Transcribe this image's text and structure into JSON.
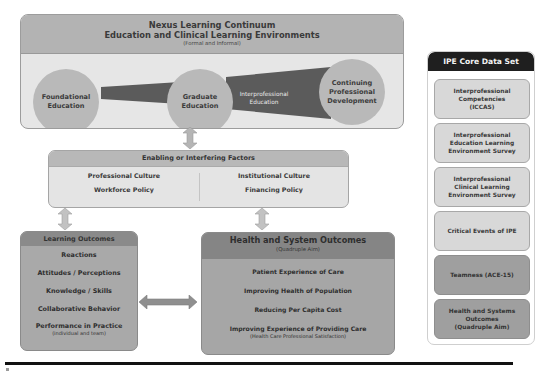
{
  "nexus": {
    "title_line1": "Nexus Learning Continuum",
    "title_line2": "Education and Clinical Learning Environments",
    "subtitle": "(Formal and Informal)",
    "stages": [
      {
        "label": "Foundational Education"
      },
      {
        "label": "Graduate Education"
      },
      {
        "label": "Interprofessional Education"
      },
      {
        "label": "Continuing Professional Development"
      }
    ]
  },
  "enabling": {
    "title": "Enabling or Interfering Factors",
    "left": [
      "Professional Culture",
      "Workforce Policy"
    ],
    "right": [
      "Institutional Culture",
      "Financing Policy"
    ]
  },
  "learning_outcomes": {
    "title": "Learning Outcomes",
    "items": [
      "Reactions",
      "Attitudes / Perceptions",
      "Knowledge / Skills",
      "Collaborative Behavior",
      "Performance in Practice"
    ],
    "last_item_note": "(individual and team)"
  },
  "health_outcomes": {
    "title": "Health and System Outcomes",
    "subtitle": "(Quadruple Aim)",
    "items": [
      "Patient Experience of Care",
      "Improving Health of Population",
      "Reducing Per Capita Cost",
      "Improving Experience of Providing Care"
    ],
    "last_item_note": "(Health Care Professional Satisfaction)"
  },
  "ipe_core": {
    "title": "IPE Core Data Set",
    "cards": [
      {
        "line1": "Interprofessional",
        "line2": "Competencies",
        "line3": "(ICCAS)",
        "shade": "light"
      },
      {
        "line1": "Interprofessional",
        "line2": "Education Learning",
        "line3": "Environment Survey",
        "shade": "light"
      },
      {
        "line1": "Interprofessional",
        "line2": "Clinical Learning",
        "line3": "Environment Survey",
        "shade": "light"
      },
      {
        "line1": "Critical Events of IPE",
        "line2": "",
        "line3": "",
        "shade": "light"
      },
      {
        "line1": "Teamness (ACE-15)",
        "line2": "",
        "line3": "",
        "shade": "dark"
      },
      {
        "line1": "Health and Systems",
        "line2": "Outcomes",
        "line3": "(Quadruple Aim)",
        "shade": "dark"
      }
    ]
  },
  "colors": {
    "header_gray": "#b3b3b3",
    "panel_light": "#e6e6e6",
    "circle": "#b9b9b9",
    "band_dark": "#5b5b5b",
    "outcome_box": "#a9a9a9",
    "ipe_header": "#1f1f1f"
  }
}
